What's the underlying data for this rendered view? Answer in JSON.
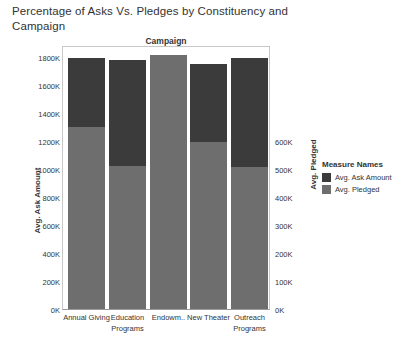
{
  "chart_data": {
    "type": "bar",
    "title": "Percentage of Asks Vs. Pledges by Constituency and Campaign",
    "subtitle": "",
    "column_header": "Campaign",
    "stacked": true,
    "categories": [
      "Annual Giving",
      "Education Programs",
      "Endowm..",
      "New Theater",
      "Outreach Programs"
    ],
    "series": [
      {
        "name": "Avg. Ask Amount",
        "axis": "left",
        "color": "#3b3b3b",
        "values": [
          1795000,
          1780000,
          1815000,
          1750000,
          1795000
        ]
      },
      {
        "name": "Avg. Pledged",
        "axis": "right",
        "color": "#6e6e6e",
        "values": [
          433000,
          340000,
          605000,
          398000,
          338000
        ]
      }
    ],
    "left_axis": {
      "label": "Avg. Ask Amount",
      "ticks": [
        "1800K",
        "1600K",
        "1400K",
        "1200K",
        "1000K",
        "800K",
        "600K",
        "400K",
        "200K",
        "0K"
      ],
      "tick_values": [
        1800000,
        1600000,
        1400000,
        1200000,
        1000000,
        800000,
        600000,
        400000,
        200000,
        0
      ],
      "min": 0,
      "max": 1860000
    },
    "right_axis": {
      "label": "Avg. Pledged",
      "ticks": [
        "600K",
        "500K",
        "400K",
        "300K",
        "200K",
        "100K",
        "0K"
      ],
      "tick_values": [
        600000,
        500000,
        400000,
        300000,
        200000,
        100000,
        0
      ],
      "min": 0,
      "max": 620000
    },
    "legend": {
      "title": "Measure Names",
      "position": "right",
      "entries": [
        {
          "label": "Avg. Ask Amount",
          "color": "#3b3b3b"
        },
        {
          "label": "Avg. Pledged",
          "color": "#6e6e6e"
        }
      ]
    },
    "grid": false,
    "bar_pixel_geometry": {
      "baseline_y": 310,
      "px_per_200k": 28,
      "bar_width": 37,
      "bar_lefts": [
        68,
        109,
        150,
        190,
        231
      ],
      "bar_tops": [
        59,
        61,
        56,
        65,
        59
      ],
      "segment_boundaries": [
        128,
        167,
        56,
        143,
        168
      ]
    }
  }
}
